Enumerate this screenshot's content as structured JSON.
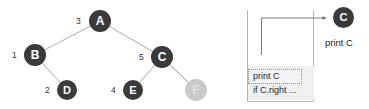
{
  "diagram": {
    "colors": {
      "node_dark": "#3a3a3a",
      "node_light": "#c9c9c9",
      "edge": "#b9b9b9",
      "panel_border": "#b6b6b6",
      "frame_fill": "#f0f0f0",
      "text": "#1d1d1d",
      "background": "#ffffff"
    },
    "tree": {
      "nodes": [
        {
          "id": "A",
          "label": "A",
          "order": "3",
          "style": "dark",
          "cx": 100,
          "cy": 21,
          "r": 11
        },
        {
          "id": "B",
          "label": "B",
          "order": "1",
          "style": "dark",
          "cx": 35,
          "cy": 55,
          "r": 11
        },
        {
          "id": "C",
          "label": "C",
          "order": "5",
          "style": "dark",
          "cx": 162,
          "cy": 57,
          "r": 11
        },
        {
          "id": "D",
          "label": "D",
          "order": "2",
          "style": "dark",
          "cx": 67,
          "cy": 90,
          "r": 10
        },
        {
          "id": "E",
          "label": "E",
          "order": "4",
          "style": "dark",
          "cx": 133,
          "cy": 90,
          "r": 10
        },
        {
          "id": "F",
          "label": "F",
          "order": "",
          "style": "light",
          "cx": 196,
          "cy": 90,
          "r": 11
        }
      ],
      "edges": [
        {
          "from": "A",
          "to": "B"
        },
        {
          "from": "A",
          "to": "C"
        },
        {
          "from": "B",
          "to": "D"
        },
        {
          "from": "C",
          "to": "E"
        },
        {
          "from": "C",
          "to": "F"
        }
      ]
    },
    "stack": {
      "frame": {
        "line_1": "print C",
        "line_2": "if C.right ..."
      }
    },
    "result": {
      "node_label": "C",
      "caption": "print C"
    }
  }
}
